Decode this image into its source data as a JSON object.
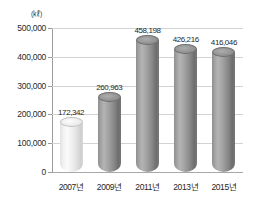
{
  "chart_data": {
    "type": "bar",
    "title": "",
    "subtitle": "",
    "xlabel": "",
    "ylabel": "",
    "unit_label": "(㎘)",
    "categories": [
      "2007년",
      "2009년",
      "2011년",
      "2013년",
      "2015년"
    ],
    "values": [
      172342,
      260963,
      458198,
      426216,
      416046
    ],
    "value_labels": [
      "172,342",
      "260,963",
      "458,198",
      "426,216",
      "416,046"
    ],
    "ylim": [
      0,
      500000
    ],
    "ytick_values": [
      0,
      100000,
      200000,
      300000,
      400000,
      500000
    ],
    "ytick_labels": [
      "0",
      "100,000",
      "200,000",
      "300,000",
      "400,000",
      "500,000"
    ],
    "grid": true,
    "grid_axis": "y",
    "legend": false,
    "legend_position": "none",
    "style": "3d-cylinder",
    "bar_colors": [
      "#f0f0f0",
      "#9a9a9a",
      "#9a9a9a",
      "#8e8e8e",
      "#9a9a9a"
    ],
    "series": [
      {
        "name": "",
        "values": [
          172342,
          260963,
          458198,
          426216,
          416046
        ]
      }
    ],
    "colors": {
      "background": "#ffffff",
      "gridline": "#d2d2d2",
      "axis": "#9a9a9a",
      "text": "#1f1f1f",
      "bar_light": "#f0f0f0",
      "bar_dark": "#9a9a9a"
    }
  }
}
